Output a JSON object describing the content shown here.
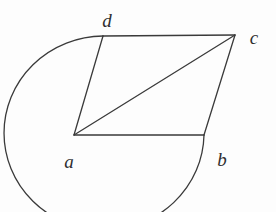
{
  "figure": {
    "kind": "geometry-diagram",
    "canvas": {
      "width": 276,
      "height": 212
    },
    "colors": {
      "background": "#fdfdfd",
      "stroke": "#3a3a3a",
      "label": "#2f2f2f"
    },
    "stroke_width": 1.3,
    "vertices": [
      {
        "id": "a",
        "label": "a",
        "x": 74,
        "y": 135,
        "label_x": 69,
        "label_y": 161
      },
      {
        "id": "b",
        "label": "b",
        "x": 204,
        "y": 135,
        "label_x": 222,
        "label_y": 159
      },
      {
        "id": "c",
        "label": "c",
        "x": 235,
        "y": 35,
        "label_x": 254,
        "label_y": 37
      },
      {
        "id": "d",
        "label": "d",
        "x": 103,
        "y": 36,
        "label_x": 107,
        "label_y": 20
      }
    ],
    "segments": [
      {
        "name": "side-ad",
        "from": "a",
        "to": "d"
      },
      {
        "name": "side-dc",
        "from": "d",
        "to": "c"
      },
      {
        "name": "side-cb",
        "from": "c",
        "to": "b"
      },
      {
        "name": "side-ab",
        "from": "a",
        "to": "b"
      },
      {
        "name": "diagonal-ac",
        "from": "a",
        "to": "c"
      }
    ],
    "arc": {
      "name": "arc-d-to-b",
      "from": "d",
      "to": "b",
      "center_x": 113,
      "center_y": 122,
      "radius_x": 100,
      "radius_y": 97,
      "large_arc": 1,
      "sweep": 0
    }
  }
}
